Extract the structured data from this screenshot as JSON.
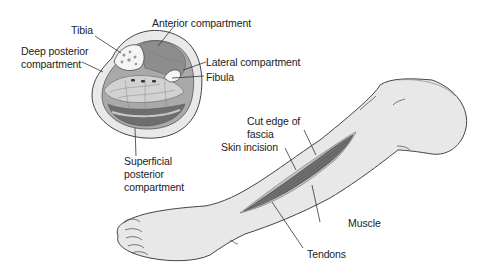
{
  "figure": {
    "colors": {
      "skin": "#e8e8e8",
      "skin_outline": "#444444",
      "muscle": "#6a6a6a",
      "compartment_fill": "#cfcfcf",
      "bone": "#f4f4f4",
      "text": "#222222"
    }
  },
  "cross_section": {
    "labels": {
      "tibia": "Tibia",
      "anterior": "Anterior compartment",
      "deep_posterior_line1": "Deep posterior",
      "deep_posterior_line2": "compartment",
      "lateral": "Lateral compartment",
      "fibula": "Fibula",
      "superficial_line1": "Superficial",
      "superficial_line2": "posterior",
      "superficial_line3": "compartment"
    }
  },
  "leg_view": {
    "labels": {
      "cut_edge_line1": "Cut edge of",
      "cut_edge_line2": "fascia",
      "skin_incision": "Skin incision",
      "muscle": "Muscle",
      "tendons": "Tendons"
    }
  }
}
